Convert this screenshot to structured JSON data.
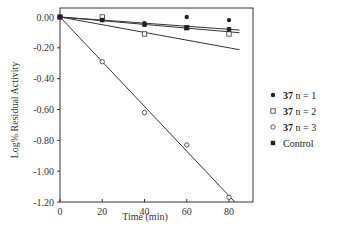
{
  "chart_data": {
    "type": "scatter",
    "title": "",
    "xlabel": "Time (min)",
    "ylabel": "Log% Residual Activity",
    "xlim": [
      0,
      85
    ],
    "ylim": [
      -1.2,
      0.05
    ],
    "xticks": [
      0,
      20,
      40,
      60,
      80
    ],
    "xtick_labels": [
      "0",
      "20",
      "40",
      "60",
      "80"
    ],
    "yticks": [
      0,
      -0.2,
      -0.4,
      -0.6,
      -0.8,
      -1.0,
      -1.2
    ],
    "ytick_labels": [
      "0.00",
      "-0.20",
      "-0.40",
      "-0.60",
      "-0.80",
      "-1.00",
      "-1.20"
    ],
    "grid": false,
    "legend_position": "right",
    "x": [
      0,
      20,
      40,
      60,
      80
    ],
    "series": [
      {
        "name": "37 n = 1",
        "compound": "37",
        "label_rest": "n = 1",
        "marker": "filled-circle",
        "values": [
          0.0,
          -0.02,
          -0.04,
          0.0,
          -0.02
        ],
        "fit": [
          0.0,
          -0.0025
        ]
      },
      {
        "name": "37 n = 2",
        "compound": "37",
        "label_rest": "n = 2",
        "marker": "open-square",
        "values": [
          0.0,
          0.0,
          -0.11,
          -0.07,
          -0.11
        ],
        "fit": [
          0.0,
          -0.0012
        ]
      },
      {
        "name": "37 n = 3",
        "compound": "37",
        "label_rest": "n = 3",
        "marker": "open-circle",
        "values": [
          0.0,
          -0.29,
          -0.62,
          -0.83,
          -1.17
        ],
        "fit": [
          0.0,
          -0.0145
        ]
      },
      {
        "name": "Control",
        "compound": "",
        "label_rest": "Control",
        "marker": "filled-square",
        "values": [
          0.0,
          -0.02,
          -0.05,
          -0.07,
          -0.08
        ],
        "fit": [
          0.0,
          -0.001
        ]
      }
    ]
  }
}
